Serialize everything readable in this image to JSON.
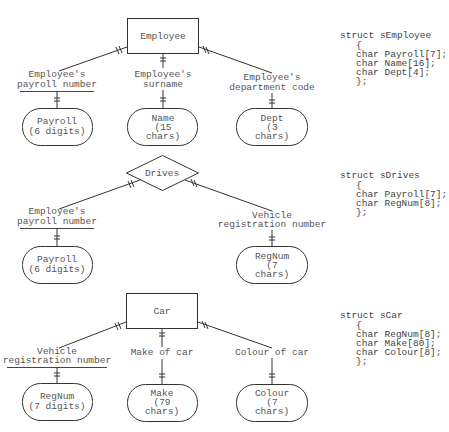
{
  "diagram": {
    "sections": [
      {
        "id": "employee",
        "node": {
          "type": "entity",
          "label": "Employee"
        },
        "attributes": [
          {
            "label_lines": [
              "Employee's",
              "payroll number"
            ],
            "key": true,
            "field_lines": [
              "Payroll",
              "(6 digits)"
            ]
          },
          {
            "label_lines": [
              "Employee's",
              "surname"
            ],
            "key": false,
            "field_lines": [
              "Name",
              "(15",
              "chars)"
            ]
          },
          {
            "label_lines": [
              "Employee's",
              "department code"
            ],
            "key": false,
            "field_lines": [
              "Dept",
              "(3",
              "chars)"
            ]
          }
        ],
        "struct": {
          "header": "struct sEmployee",
          "open": "{",
          "members": [
            "char Payroll[7];",
            "char Name[16];",
            "char Dept[4];"
          ],
          "close": "};"
        }
      },
      {
        "id": "drives",
        "node": {
          "type": "relationship",
          "label": "Drives"
        },
        "attributes": [
          {
            "label_lines": [
              "Employee's",
              "payroll number"
            ],
            "key": true,
            "field_lines": [
              "Payroll",
              "(6 digits)"
            ]
          },
          {
            "label_lines": [
              "Vehicle",
              "registration number"
            ],
            "key": false,
            "field_lines": [
              "RegNum",
              "(7",
              "chars)"
            ]
          }
        ],
        "struct": {
          "header": "struct sDrives",
          "open": "{",
          "members": [
            "char Payroll[7];",
            "char RegNum[8];"
          ],
          "close": "};"
        }
      },
      {
        "id": "car",
        "node": {
          "type": "entity",
          "label": "Car"
        },
        "attributes": [
          {
            "label_lines": [
              "Vehicle",
              "registration number"
            ],
            "key": true,
            "field_lines": [
              "RegNum",
              "(7 digits)"
            ]
          },
          {
            "label_lines": [
              "Make of car"
            ],
            "key": false,
            "field_lines": [
              "Make",
              "(79",
              "chars)"
            ]
          },
          {
            "label_lines": [
              "Colour of car"
            ],
            "key": false,
            "field_lines": [
              "Colour",
              "(7",
              "chars)"
            ]
          }
        ],
        "struct": {
          "header": "struct sCar",
          "open": "{",
          "members": [
            "char RegNum[8];",
            "char Make[80];",
            "char Colour[8];"
          ],
          "close": "};"
        }
      }
    ]
  }
}
